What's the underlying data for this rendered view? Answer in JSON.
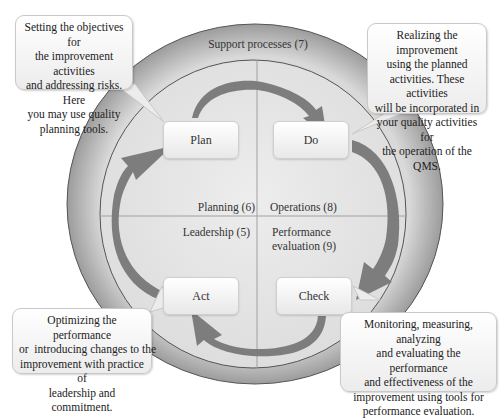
{
  "diagram": {
    "outer_ring_label": "Support processes (7)",
    "quadrants": [
      {
        "id": "plan",
        "step": "Plan",
        "clause": "Planning (6)"
      },
      {
        "id": "do",
        "step": "Do",
        "clause": "Operations (8)"
      },
      {
        "id": "check",
        "step": "Check",
        "clause_line1": "Performance",
        "clause_line2": "evaluation (9)"
      },
      {
        "id": "act",
        "step": "Act",
        "clause": "Leadership (5)"
      }
    ],
    "callouts": {
      "plan": [
        "Setting the objectives for",
        "the improvement activities",
        "and addressing risks. Here",
        "you may use quality",
        "planning tools."
      ],
      "do": [
        "Realizing the improvement",
        "using the planned",
        "activities. These activities",
        "will be incorporated in",
        "your quality activities for",
        "the operation of the QMS."
      ],
      "act": [
        "Optimizing the performance",
        "or  introducing changes to the",
        "improvement with practice of",
        "leadership and commitment."
      ],
      "check": [
        "Monitoring, measuring, analyzing",
        "and evaluating the performance",
        "and effectiveness of the",
        "improvement using tools for",
        "performance evaluation."
      ]
    },
    "colors": {
      "outer_ring": "#a9a9a9",
      "inner_disc": "#e4e4e4",
      "arrow": "#7d7d7d",
      "box_border": "#cfcfcf"
    }
  }
}
